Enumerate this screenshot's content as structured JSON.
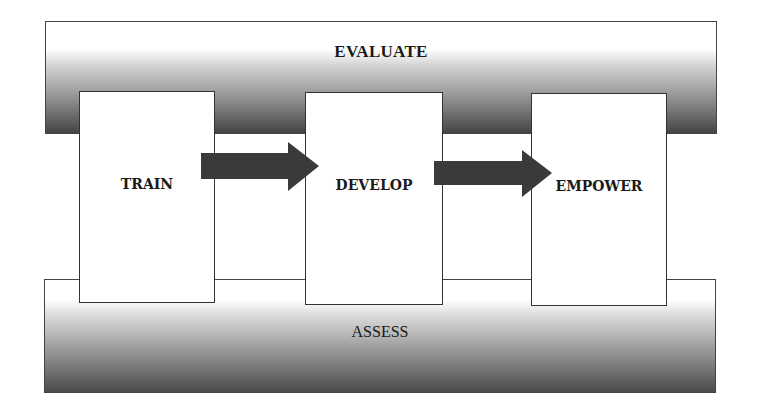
{
  "diagram": {
    "top_band": {
      "label": "EVALUATE"
    },
    "bottom_band": {
      "label": "ASSESS"
    },
    "stages": [
      {
        "label": "TRAIN"
      },
      {
        "label": "DEVELOP"
      },
      {
        "label": "EMPOWER"
      }
    ],
    "arrows": [
      {
        "from": "TRAIN",
        "to": "DEVELOP"
      },
      {
        "from": "DEVELOP",
        "to": "EMPOWER"
      }
    ],
    "colors": {
      "arrow_fill": "#3a3a3a",
      "border": "#333333",
      "gradient_dark": "#444444"
    }
  }
}
